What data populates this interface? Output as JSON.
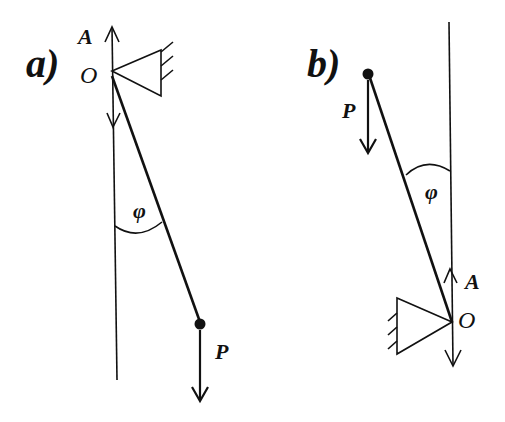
{
  "figure_a": {
    "panel_label": "a)",
    "pivot_label": "O",
    "axis_label": "A",
    "angle_label": "φ",
    "force_label": "P"
  },
  "figure_b": {
    "panel_label": "b)",
    "pivot_label": "O",
    "axis_label": "A",
    "angle_label": "φ",
    "force_label": "P"
  },
  "colors": {
    "ink": "#111111",
    "background": "#ffffff"
  }
}
